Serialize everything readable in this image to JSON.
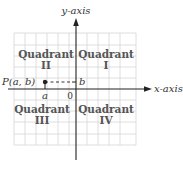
{
  "diagram": {
    "axes": {
      "y_label": "y-axis",
      "x_label": "x-axis",
      "origin_label": "0"
    },
    "quadrants": [
      {
        "word": "Quadrant",
        "numeral": "I"
      },
      {
        "word": "Quadrant",
        "numeral": "II"
      },
      {
        "word": "Quadrant",
        "numeral": "III"
      },
      {
        "word": "Quadrant",
        "numeral": "IV"
      }
    ],
    "point": {
      "label": "P(a, b)",
      "x_label": "a",
      "y_label": "b"
    },
    "colors": {
      "grid": "#cfcfcf",
      "axis": "#222222",
      "text": "#333333"
    }
  }
}
